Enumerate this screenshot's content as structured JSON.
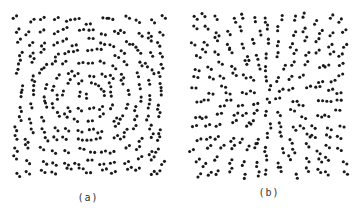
{
  "figure": {
    "dot_color": "#1a1a1a",
    "dot_radius": 1.55,
    "pair_separation": 4.2,
    "panels": [
      {
        "id": "a",
        "caption": "(a)",
        "pattern": "concentric",
        "description": "Glass pattern of dot pairs oriented tangentially (rotational/concentric circles)",
        "bounds": {
          "x": 13,
          "y": 15,
          "width": 154,
          "height": 162
        },
        "center": {
          "x": 90,
          "y": 96
        },
        "pair_count": 190,
        "seed": 7,
        "caption_pos": {
          "x": 88,
          "y": 192
        }
      },
      {
        "id": "b",
        "caption": "(b)",
        "pattern": "radial",
        "description": "Glass pattern of dot pairs oriented radially (expanding from center)",
        "bounds": {
          "x": 189,
          "y": 13,
          "width": 159,
          "height": 166
        },
        "center": {
          "x": 268,
          "y": 100
        },
        "pair_count": 180,
        "seed": 13,
        "caption_pos": {
          "x": 269,
          "y": 187
        }
      }
    ]
  }
}
